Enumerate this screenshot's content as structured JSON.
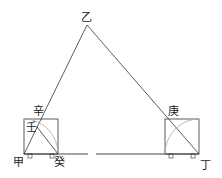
{
  "diagram": {
    "labels": {
      "apex": "乙",
      "left_base": "甲",
      "right_base": "丁",
      "left_box_foot": "癸",
      "left_box_top": "辛",
      "left_box_intersect": "壬",
      "right_box_top": "庚"
    },
    "colors": {
      "line": "#333333",
      "arc": "#aaaaaa",
      "background": "#ffffff"
    }
  }
}
